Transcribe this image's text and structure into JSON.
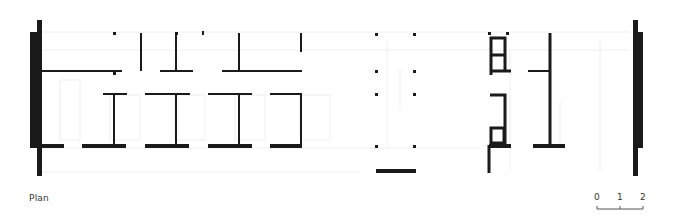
{
  "caption": {
    "label": "Plan"
  },
  "scale_bar": {
    "ticks": [
      "0",
      "1",
      "2"
    ]
  },
  "colors": {
    "wall": "#1a1a1a",
    "faint_line": "#eeeeee",
    "background": "#ffffff",
    "text": "#333333"
  }
}
